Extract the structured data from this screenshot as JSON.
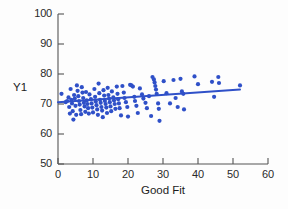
{
  "chart_data": {
    "type": "scatter",
    "title": "",
    "xlabel": "Good Fit",
    "ylabel": "Y1",
    "xlim": [
      0,
      60
    ],
    "ylim": [
      50,
      100
    ],
    "xticks": [
      0,
      10,
      20,
      30,
      40,
      50,
      60
    ],
    "yticks": [
      50,
      60,
      70,
      80,
      90,
      100
    ],
    "grid": false,
    "legend": false,
    "point_color": "#2f50c8",
    "line_color": "#2f50c8",
    "axis_color": "#555555",
    "background_color": "#ffffff",
    "series": [
      {
        "name": "observations",
        "marker": "circle",
        "points": [
          [
            1.0,
            73.4
          ],
          [
            2.2,
            70.6
          ],
          [
            2.6,
            71.0
          ],
          [
            3.0,
            72.2
          ],
          [
            3.2,
            69.0
          ],
          [
            3.4,
            66.8
          ],
          [
            3.6,
            75.0
          ],
          [
            3.8,
            71.4
          ],
          [
            4.0,
            70.2
          ],
          [
            4.2,
            67.6
          ],
          [
            4.4,
            64.8
          ],
          [
            4.6,
            73.0
          ],
          [
            4.8,
            71.8
          ],
          [
            5.0,
            69.4
          ],
          [
            5.2,
            66.4
          ],
          [
            5.4,
            76.2
          ],
          [
            5.6,
            74.4
          ],
          [
            5.8,
            72.6
          ],
          [
            6.0,
            71.0
          ],
          [
            6.2,
            69.8
          ],
          [
            6.4,
            68.0
          ],
          [
            6.6,
            66.6
          ],
          [
            6.8,
            75.6
          ],
          [
            7.0,
            73.8
          ],
          [
            7.2,
            72.0
          ],
          [
            7.4,
            70.4
          ],
          [
            7.6,
            69.2
          ],
          [
            7.8,
            67.4
          ],
          [
            8.0,
            74.0
          ],
          [
            8.2,
            71.2
          ],
          [
            8.4,
            70.0
          ],
          [
            8.6,
            68.6
          ],
          [
            8.8,
            66.8
          ],
          [
            9.0,
            73.2
          ],
          [
            9.4,
            71.6
          ],
          [
            9.6,
            70.2
          ],
          [
            9.8,
            68.8
          ],
          [
            10.0,
            67.2
          ],
          [
            10.4,
            75.0
          ],
          [
            10.6,
            72.4
          ],
          [
            10.8,
            70.8
          ],
          [
            11.0,
            69.6
          ],
          [
            11.2,
            68.2
          ],
          [
            11.4,
            66.4
          ],
          [
            11.6,
            76.8
          ],
          [
            11.8,
            73.6
          ],
          [
            12.0,
            71.4
          ],
          [
            12.2,
            70.4
          ],
          [
            12.4,
            69.0
          ],
          [
            12.6,
            67.8
          ],
          [
            12.8,
            65.6
          ],
          [
            13.0,
            74.6
          ],
          [
            13.2,
            72.8
          ],
          [
            13.4,
            71.0
          ],
          [
            13.6,
            70.0
          ],
          [
            13.8,
            68.8
          ],
          [
            14.0,
            67.0
          ],
          [
            14.2,
            75.4
          ],
          [
            14.4,
            73.0
          ],
          [
            14.6,
            71.8
          ],
          [
            14.8,
            70.6
          ],
          [
            15.0,
            69.2
          ],
          [
            15.2,
            67.6
          ],
          [
            15.4,
            74.2
          ],
          [
            15.8,
            72.2
          ],
          [
            16.0,
            71.2
          ],
          [
            16.2,
            70.0
          ],
          [
            16.4,
            68.4
          ],
          [
            16.8,
            75.8
          ],
          [
            17.0,
            73.4
          ],
          [
            17.2,
            71.6
          ],
          [
            17.4,
            70.2
          ],
          [
            17.6,
            68.6
          ],
          [
            18.0,
            66.2
          ],
          [
            18.4,
            76.0
          ],
          [
            18.8,
            73.8
          ],
          [
            19.0,
            72.0
          ],
          [
            19.4,
            70.6
          ],
          [
            19.8,
            69.0
          ],
          [
            20.0,
            65.8
          ],
          [
            20.6,
            76.4
          ],
          [
            21.0,
            76.2
          ],
          [
            21.4,
            75.8
          ],
          [
            21.8,
            72.4
          ],
          [
            22.0,
            71.0
          ],
          [
            22.4,
            69.4
          ],
          [
            22.8,
            67.0
          ],
          [
            23.4,
            75.2
          ],
          [
            24.0,
            73.2
          ],
          [
            24.4,
            71.8
          ],
          [
            25.0,
            70.4
          ],
          [
            25.4,
            68.6
          ],
          [
            26.0,
            72.6
          ],
          [
            26.6,
            66.0
          ],
          [
            27.0,
            79.0
          ],
          [
            27.4,
            78.2
          ],
          [
            27.6,
            77.2
          ],
          [
            27.8,
            76.0
          ],
          [
            28.0,
            74.8
          ],
          [
            28.2,
            73.4
          ],
          [
            28.6,
            70.2
          ],
          [
            28.8,
            68.4
          ],
          [
            29.0,
            64.4
          ],
          [
            30.2,
            77.6
          ],
          [
            31.0,
            73.6
          ],
          [
            32.0,
            70.2
          ],
          [
            33.0,
            78.0
          ],
          [
            33.6,
            72.0
          ],
          [
            34.2,
            69.0
          ],
          [
            35.0,
            78.4
          ],
          [
            35.4,
            74.2
          ],
          [
            35.8,
            73.4
          ],
          [
            36.0,
            68.2
          ],
          [
            39.0,
            79.2
          ],
          [
            40.0,
            76.6
          ],
          [
            44.0,
            77.4
          ],
          [
            44.6,
            72.4
          ],
          [
            45.8,
            79.0
          ],
          [
            46.0,
            77.0
          ],
          [
            52.0,
            76.2
          ]
        ]
      }
    ],
    "trendline": {
      "name": "fit",
      "x": [
        0,
        52
      ],
      "y": [
        70.6,
        74.8
      ]
    }
  }
}
